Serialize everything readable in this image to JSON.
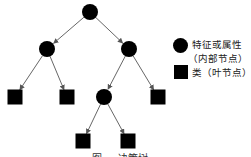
{
  "diagram": {
    "type": "decision-tree",
    "nodes": [
      {
        "id": "root",
        "kind": "internal"
      },
      {
        "id": "n1",
        "kind": "internal",
        "parent": "root"
      },
      {
        "id": "n2",
        "kind": "internal",
        "parent": "root"
      },
      {
        "id": "l1",
        "kind": "leaf",
        "parent": "n1"
      },
      {
        "id": "l2",
        "kind": "leaf",
        "parent": "n1"
      },
      {
        "id": "n3",
        "kind": "internal",
        "parent": "n2"
      },
      {
        "id": "l3",
        "kind": "leaf",
        "parent": "n2"
      },
      {
        "id": "l4",
        "kind": "leaf",
        "parent": "n3"
      },
      {
        "id": "l5",
        "kind": "leaf",
        "parent": "n3"
      }
    ],
    "colors": {
      "node": "#000000",
      "edge": "#555555"
    }
  },
  "legend": {
    "internal_label_line1": "特征或属性",
    "internal_label_line2": "（内部节点）",
    "leaf_label": "类（叶节点）"
  },
  "caption": "图 … 决策树"
}
